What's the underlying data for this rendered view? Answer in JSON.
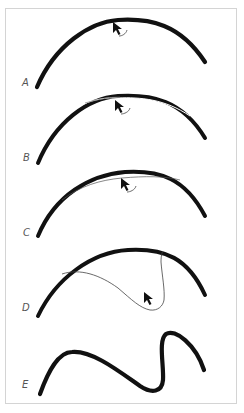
{
  "figure": {
    "panels": [
      {
        "id": "A",
        "label": "A",
        "description": "Thick arc stroke; cursor positioned on the arc with a small curved motion hint"
      },
      {
        "id": "B",
        "label": "B",
        "description": "Arc with thin trailing lasso lines along the top; cursor on arc"
      },
      {
        "id": "C",
        "label": "C",
        "description": "Arc with a thin inner selection line pulled slightly below; cursor on the line"
      },
      {
        "id": "D",
        "label": "D",
        "description": "Arc with a thin freehand lasso loop dragged down into the interior; cursor at the bottom of the loop"
      },
      {
        "id": "E",
        "label": "E",
        "description": "Resulting reshaped thick S-like squiggle stroke"
      }
    ],
    "colors": {
      "stroke": "#111111",
      "thin_line": "#555555",
      "frame": "#d4d4d4",
      "label": "#555555",
      "background": "#ffffff"
    }
  }
}
